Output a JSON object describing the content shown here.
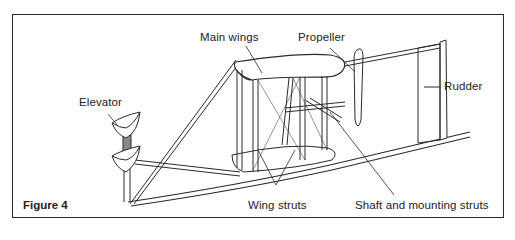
{
  "figure": {
    "caption": "Figure 4"
  },
  "labels": {
    "main_wings": "Main wings",
    "propeller": "Propeller",
    "rudder": "Rudder",
    "elevator": "Elevator",
    "wing_struts": "Wing struts",
    "shaft_and_mounting_struts": "Shaft and mounting struts"
  },
  "colors": {
    "line": "#2a2a2a",
    "background": "#ffffff"
  }
}
